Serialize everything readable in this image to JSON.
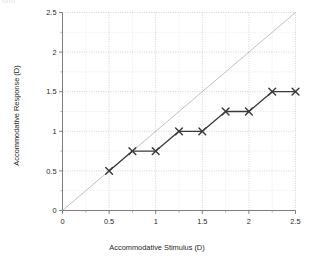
{
  "figure": {
    "crop_fragment_text": "ion)",
    "background_color": "#ffffff"
  },
  "chart_data": {
    "type": "line",
    "title": "",
    "subtitle": "",
    "xlabel": "Accommodative Stimulus (D)",
    "ylabel": "Accommodative Response (D)",
    "xlim": [
      0,
      2.5
    ],
    "ylim": [
      0,
      2.5
    ],
    "xticks": [
      0,
      0.5,
      1,
      1.5,
      2,
      2.5
    ],
    "yticks": [
      0,
      0.5,
      1,
      1.5,
      2,
      2.5
    ],
    "xticklabels": [
      "0",
      "0.5",
      "1",
      "1.5",
      "2",
      "2.5"
    ],
    "yticklabels": [
      "0",
      "0.5",
      "1",
      "1.5",
      "2",
      "2.5"
    ],
    "minor_tick_step": 0.25,
    "grid": true,
    "grid_style": "dotted",
    "grid_color": "#c9c9c9",
    "legend": false,
    "legend_position": "none",
    "series": [
      {
        "name": "Accommodative response",
        "marker": "x",
        "color": "#3a3a3a",
        "linewidth": 1.3,
        "x": [
          0.5,
          0.75,
          1.0,
          1.25,
          1.5,
          1.75,
          2.0,
          2.25,
          2.5
        ],
        "y": [
          0.5,
          0.75,
          0.75,
          1.0,
          1.0,
          1.25,
          1.25,
          1.5,
          1.5
        ]
      },
      {
        "name": "1:1 reference line",
        "marker": "none",
        "color": "#b0b0b0",
        "linewidth": 0.8,
        "x": [
          0,
          2.5
        ],
        "y": [
          0,
          2.5
        ]
      }
    ],
    "annotations": []
  }
}
